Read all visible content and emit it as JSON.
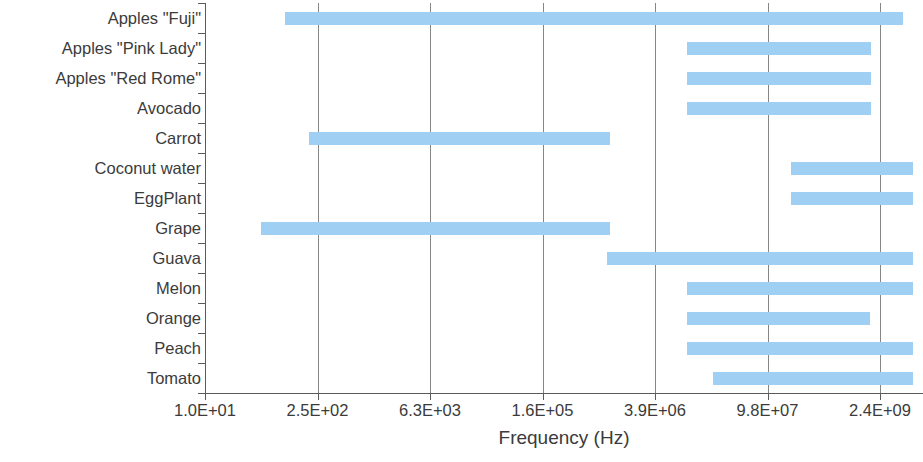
{
  "chart_data": {
    "type": "bar",
    "orientation": "horizontal",
    "subtype": "range-bar",
    "title": "",
    "xlabel": "Frequency (Hz)",
    "ylabel": "",
    "xscale": "log",
    "grid": true,
    "legend": null,
    "legend_position": "none",
    "bar_color": "#9FCFF2",
    "axis_color": "#5A5A5A",
    "grid_color": "#868686",
    "text_color": "#3B3B3B",
    "xtick_labels": [
      "1.0E+01",
      "2.5E+02",
      "6.3E+03",
      "1.6E+05",
      "3.9E+06",
      "9.8E+07",
      "2.4E+09"
    ],
    "xtick_values": [
      10,
      250,
      6300,
      160000,
      3900000,
      98000000,
      2400000000
    ],
    "xlim": [
      10,
      2400000000
    ],
    "categories": [
      "Apples \"Fuji\"",
      "Apples \"Pink Lady\"",
      "Apples \"Red Rome\"",
      "Avocado",
      "Carrot",
      "Coconut water",
      "EggPlant",
      "Grape",
      "Guava",
      "Melon",
      "Orange",
      "Peach",
      "Tomato"
    ],
    "ranges": [
      {
        "category": "Apples \"Fuji\"",
        "start": 110.0,
        "end": 5000000000.0
      },
      {
        "category": "Apples \"Pink Lady\"",
        "start": 11000000.0,
        "end": 1700000000.0
      },
      {
        "category": "Apples \"Red Rome\"",
        "start": 11000000.0,
        "end": 1700000000.0
      },
      {
        "category": "Avocado",
        "start": 11000000.0,
        "end": 1700000000.0
      },
      {
        "category": "Carrot",
        "start": 220.0,
        "end": 1400000.0
      },
      {
        "category": "Coconut water",
        "start": 220000000.0,
        "end": 5800000000.0
      },
      {
        "category": "EggPlant",
        "start": 220000000.0,
        "end": 5800000000.0
      },
      {
        "category": "Grape",
        "start": 75.0,
        "end": 1400000.0
      },
      {
        "category": "Guava",
        "start": 1400000.0,
        "end": 5800000000.0
      },
      {
        "category": "Melon",
        "start": 11000000.0,
        "end": 5800000000.0
      },
      {
        "category": "Orange",
        "start": 11000000.0,
        "end": 1700000000.0
      },
      {
        "category": "Peach",
        "start": 11000000.0,
        "end": 5800000000.0
      },
      {
        "category": "Tomato",
        "start": 35000000.0,
        "end": 5800000000.0
      }
    ],
    "bar_pixels": [
      {
        "x1": 285,
        "x2": 903
      },
      {
        "x1": 687,
        "x2": 871
      },
      {
        "x1": 687,
        "x2": 871
      },
      {
        "x1": 687,
        "x2": 871
      },
      {
        "x1": 309,
        "x2": 610
      },
      {
        "x1": 791,
        "x2": 913
      },
      {
        "x1": 791,
        "x2": 913
      },
      {
        "x1": 261,
        "x2": 610
      },
      {
        "x1": 607,
        "x2": 913
      },
      {
        "x1": 687,
        "x2": 913
      },
      {
        "x1": 687,
        "x2": 870
      },
      {
        "x1": 687,
        "x2": 913
      },
      {
        "x1": 713,
        "x2": 913
      }
    ]
  }
}
